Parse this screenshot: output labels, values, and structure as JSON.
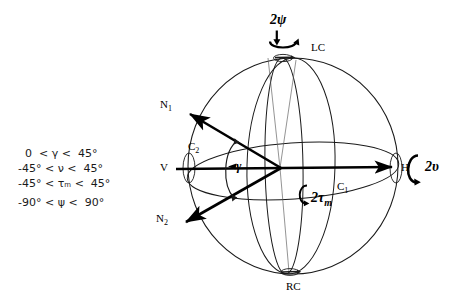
{
  "figure": {
    "type": "3d-sphere-orientation-diagram",
    "background": "#ffffff",
    "ink": "#000000"
  },
  "constraints": {
    "lines": [
      "  0  < γ <  45°",
      "-45° < ν <  45°",
      "-45° < τₘ <  45°",
      "-90° < ψ <  90°"
    ]
  },
  "labels": {
    "lc": "LC",
    "rc": "RC",
    "v": "V",
    "h": "H",
    "n1": "N",
    "n1_sub": "1",
    "n2": "N",
    "n2_sub": "2",
    "c1": "C",
    "c1_sub": "1",
    "c2": "C",
    "c2_sub": "2"
  },
  "rotations": {
    "psi": "2ψ",
    "nu": "2υ",
    "tau_m": "2τ",
    "tau_m_sub": "m"
  },
  "angles": {
    "gamma": "γ"
  }
}
